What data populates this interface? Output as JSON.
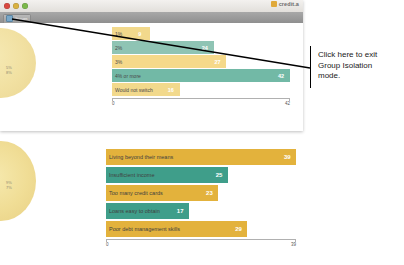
{
  "window": {
    "traffic_lights": [
      "close",
      "minimize",
      "zoom"
    ],
    "brand_text": "credit.a",
    "toolbar": {
      "isolation_button_label": "Groups"
    }
  },
  "pies": {
    "top_labels": [
      "5%",
      "8%"
    ],
    "bottom_labels": [
      "9%",
      "7%"
    ]
  },
  "callout": {
    "line1": "Click here to exit",
    "line2": "Group Isolation",
    "line3": "mode."
  },
  "chart_data": [
    {
      "id": "top",
      "type": "bar",
      "orientation": "horizontal",
      "title": "",
      "xlabel": "",
      "ylabel": "",
      "categories": [
        "1%",
        "2%",
        "3%",
        "4% or more",
        "Would not switch"
      ],
      "values": [
        9,
        24,
        27,
        42,
        16
      ],
      "colors": [
        "#f2d98c",
        "#8fc4b4",
        "#f5d98a",
        "#72b9a6",
        "#f2d98c"
      ],
      "xlim": [
        0,
        42
      ],
      "axis_min_label": "0",
      "axis_max_label": "42",
      "grid": false,
      "legend": "none"
    },
    {
      "id": "bottom",
      "type": "bar",
      "orientation": "horizontal",
      "title": "",
      "xlabel": "",
      "ylabel": "",
      "categories": [
        "Living beyond their means",
        "Insufficient income",
        "Too many credit cards",
        "Loans easy to obtain",
        "Poor debt management skills"
      ],
      "values": [
        39,
        25,
        23,
        17,
        29
      ],
      "colors": [
        "#e3b23c",
        "#3f9e8a",
        "#e3b23c",
        "#3f9e8a",
        "#e3b23c"
      ],
      "xlim": [
        0,
        39
      ],
      "axis_min_label": "0",
      "axis_max_label": "39",
      "grid": false,
      "legend": "none"
    }
  ]
}
